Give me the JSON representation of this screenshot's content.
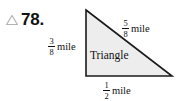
{
  "problem": {
    "marker_icon": "triangle-outline-icon",
    "number": "78."
  },
  "figure": {
    "shape_name": "triangle",
    "inner_label": "Triangle",
    "fill_color": "#ededed",
    "stroke_color": "#1a1a1a",
    "background_color": "#ffffff",
    "vertices": {
      "apex": [
        86,
        10
      ],
      "bottom_left": [
        86,
        76
      ],
      "bottom_right": [
        172,
        76
      ]
    },
    "labels": [
      {
        "name": "left-side-measure",
        "position": "left",
        "numerator": "3",
        "denominator": "8",
        "unit": "mile"
      },
      {
        "name": "hypotenuse-measure",
        "position": "hypotenuse",
        "numerator": "5",
        "denominator": "8",
        "unit": "mile"
      },
      {
        "name": "base-measure",
        "position": "bottom",
        "numerator": "1",
        "denominator": "2",
        "unit": "mile"
      }
    ]
  }
}
